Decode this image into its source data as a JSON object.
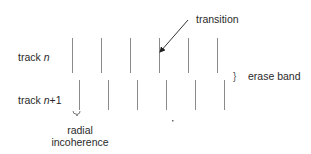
{
  "diagram": {
    "tracks": [
      {
        "label_prefix": "track ",
        "label_var": "n",
        "label_suffix": "",
        "y_top": 38,
        "y_bottom": 73,
        "label_y": 51,
        "transitions_x": [
          72,
          101,
          130,
          159,
          188,
          217
        ]
      },
      {
        "label_prefix": "track ",
        "label_var": "n",
        "label_suffix": "+1",
        "y_top": 80,
        "y_bottom": 110,
        "label_y": 94,
        "transitions_x": [
          79,
          108,
          137,
          166,
          195,
          224
        ]
      }
    ],
    "annotations": {
      "transition": {
        "text": "transition",
        "arrow_from": [
          188,
          20
        ],
        "arrow_to": [
          160,
          52
        ]
      },
      "erase_band": {
        "brace": "}",
        "text": "erase band"
      },
      "radial_incoherence": {
        "line1": "radial",
        "line2": "incoherence"
      }
    },
    "colors": {
      "line": "#8a8a8a",
      "text": "#2a2a2a",
      "arrow": "#333333",
      "background": "#ffffff"
    }
  }
}
